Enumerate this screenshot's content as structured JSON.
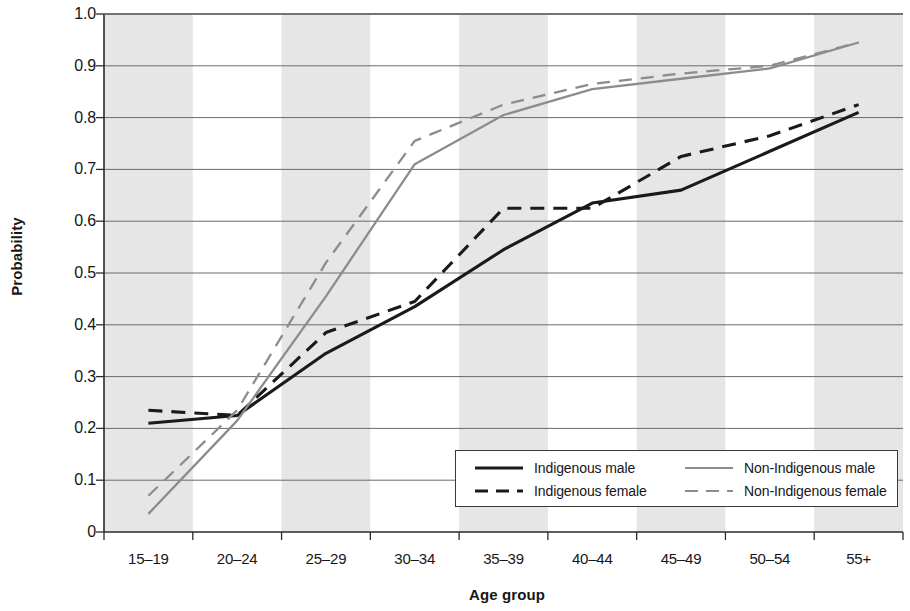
{
  "chart_data": {
    "type": "line",
    "title": "",
    "xlabel": "Age group",
    "ylabel": "Probability",
    "categories": [
      "15–19",
      "20–24",
      "25–29",
      "30–34",
      "35–39",
      "40–44",
      "45–49",
      "50–54",
      "55+"
    ],
    "ylim": [
      0,
      1.0
    ],
    "yticks": [
      "0",
      "0.1",
      "0.2",
      "0.3",
      "0.4",
      "0.5",
      "0.6",
      "0.7",
      "0.8",
      "0.9",
      "1.0"
    ],
    "ytick_values": [
      0,
      0.1,
      0.2,
      0.3,
      0.4,
      0.5,
      0.6,
      0.7,
      0.8,
      0.9,
      1.0
    ],
    "grid": "horizontal",
    "banding": "alternating vertical grey bands, first category shaded",
    "legend_position": "inside lower right",
    "series": [
      {
        "name": "Indigenous male",
        "color": "#1a1a1a",
        "style": "solid",
        "values": [
          0.21,
          0.225,
          0.345,
          0.435,
          0.545,
          0.635,
          0.66,
          0.735,
          0.81
        ]
      },
      {
        "name": "Indigenous female",
        "color": "#1a1a1a",
        "style": "dashed",
        "values": [
          0.235,
          0.225,
          0.385,
          0.445,
          0.625,
          0.625,
          0.725,
          0.765,
          0.825
        ]
      },
      {
        "name": "Non-Indigenous male",
        "color": "#8c8c8c",
        "style": "solid",
        "values": [
          0.035,
          0.215,
          0.455,
          0.71,
          0.805,
          0.855,
          0.875,
          0.895,
          0.945
        ]
      },
      {
        "name": "Non-Indigenous female",
        "color": "#8c8c8c",
        "style": "dashed",
        "values": [
          0.07,
          0.235,
          0.52,
          0.755,
          0.825,
          0.865,
          0.885,
          0.9,
          0.945
        ]
      }
    ]
  },
  "axis": {
    "ylabel": "Probability",
    "xlabel": "Age group"
  },
  "legend": {
    "entries": [
      {
        "label": "Indigenous male"
      },
      {
        "label": "Indigenous female"
      },
      {
        "label": "Non-Indigenous male"
      },
      {
        "label": "Non-Indigenous female"
      }
    ]
  },
  "colors": {
    "indigenous": "#1a1a1a",
    "non_indigenous": "#8c8c8c",
    "band": "#e6e6e6",
    "grid": "#6b6b6b",
    "axis": "#2b2b2b"
  }
}
